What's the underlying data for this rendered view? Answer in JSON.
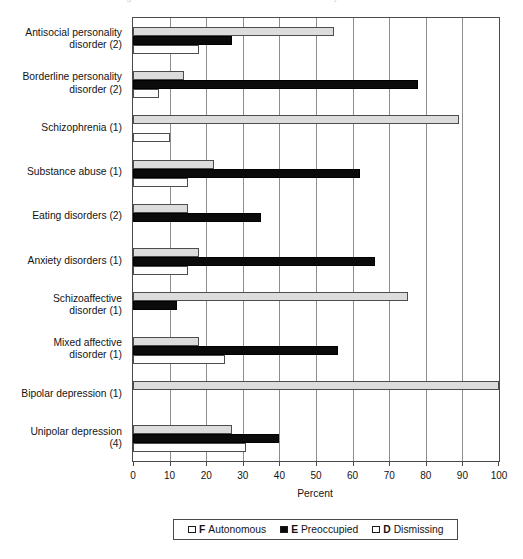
{
  "figure": {
    "cropped_caption_top": "Figure 1. Attachment classification distributions by disorder",
    "xlabel": "Percent",
    "x_ticks": [
      "0",
      "10",
      "20",
      "30",
      "40",
      "50",
      "60",
      "70",
      "80",
      "90",
      "100"
    ]
  },
  "legend": {
    "items": [
      {
        "code": "F",
        "label": "Autonomous",
        "swatch": "open-square-white",
        "color": "#ffffff"
      },
      {
        "code": "E",
        "label": "Preoccupied",
        "swatch": "filled-square-black",
        "color": "#0b0b0b"
      },
      {
        "code": "D",
        "label": "Dismissing",
        "swatch": "open-square-light",
        "color": "#dcdcdc"
      }
    ]
  },
  "chart_data": {
    "type": "bar",
    "orientation": "horizontal",
    "title": "",
    "xlabel": "Percent",
    "ylabel": "",
    "xlim": [
      0,
      100
    ],
    "grid": true,
    "legend_position": "bottom",
    "categories": [
      "Antisocial personality\ndisorder (2)",
      "Borderline personality\ndisorder (2)",
      "Schizophrenia (1)",
      "Substance abuse (1)",
      "Eating disorders (2)",
      "Anxiety disorders (1)",
      "Schizoaffective\ndisorder (1)",
      "Mixed affective\ndisorder (1)",
      "Bipolar depression (1)",
      "Unipolar depression\n(4)"
    ],
    "series": [
      {
        "name": "D Dismissing",
        "code": "D",
        "color": "#dcdcdc",
        "values": [
          55,
          14,
          89,
          22,
          15,
          18,
          75,
          18,
          100,
          27
        ]
      },
      {
        "name": "E Preoccupied",
        "code": "E",
        "color": "#0b0b0b",
        "values": [
          27,
          78,
          0,
          62,
          35,
          66,
          12,
          56,
          0,
          40
        ]
      },
      {
        "name": "F Autonomous",
        "code": "F",
        "color": "#ffffff",
        "values": [
          18,
          7,
          10,
          15,
          0,
          15,
          0,
          25,
          0,
          31
        ]
      }
    ]
  }
}
